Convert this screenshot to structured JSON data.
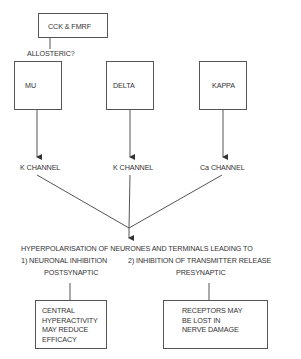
{
  "diagram": {
    "top_box": {
      "label": "CCK & FMRF"
    },
    "allosteric_label": "ALLOSTERIC?",
    "receptors": [
      {
        "label": "MU",
        "channel": "K CHANNEL"
      },
      {
        "label": "DELTA",
        "channel": "K CHANNEL"
      },
      {
        "label": "KAPPA",
        "channel": "Ca CHANNEL"
      }
    ],
    "outcome": {
      "line1": "HYPERPOLARISATION OF NEURONES AND TERMINALS LEADING TO",
      "left_heading": "1) NEURONAL INHIBITION",
      "left_sub": "POSTSYNAPTIC",
      "right_heading": "2) INHIBITION OF TRANSMITTER RELEASE",
      "right_sub": "PRESYNAPTIC"
    },
    "bottom_boxes": [
      {
        "lines": [
          "CENTRAL",
          "HYPERACTIVITY",
          "MAY REDUCE",
          "EFFICACY"
        ]
      },
      {
        "lines": [
          "RECEPTORS MAY",
          "BE LOST IN",
          "NERVE DAMAGE"
        ]
      }
    ]
  }
}
